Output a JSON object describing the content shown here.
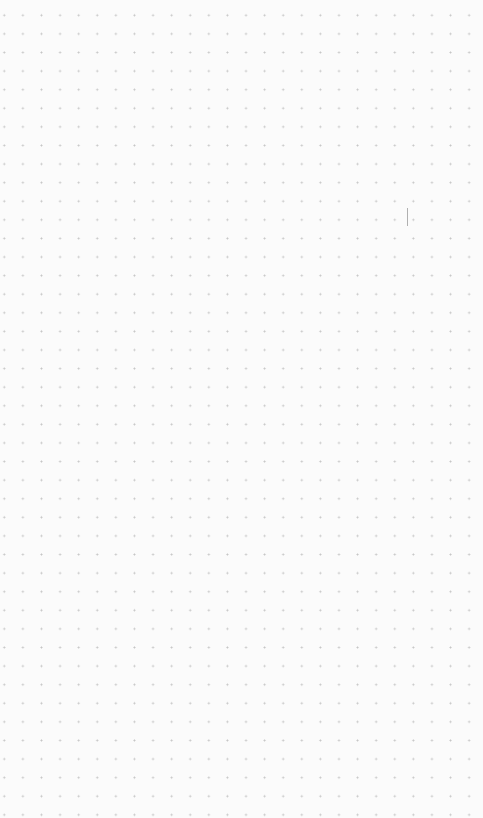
{
  "canvas": {
    "background_color": "#fbfbfb",
    "dot_color": "#c4c4c4",
    "grid_spacing_px": 18.6
  },
  "cursor": {
    "type": "text-caret"
  }
}
